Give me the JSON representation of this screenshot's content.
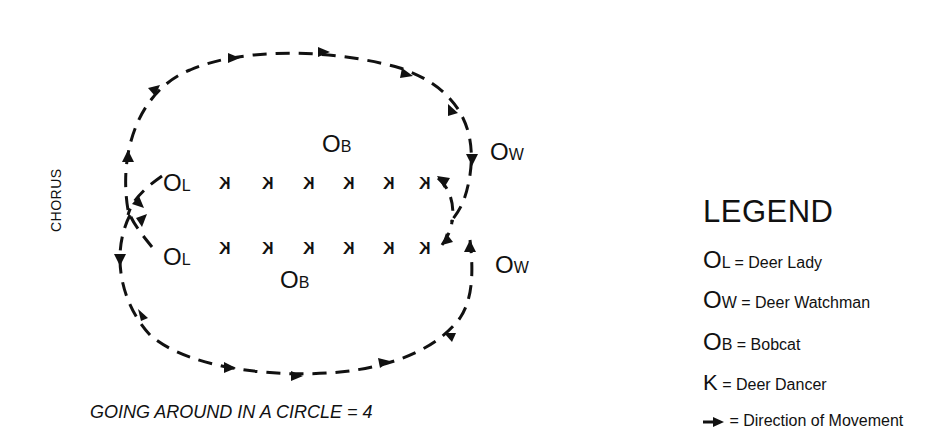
{
  "diagram": {
    "title": "",
    "side_label": "CHORUS",
    "caption": "GOING AROUND IN A CIRCLE = 4",
    "dancer_glyph": "K",
    "figures": {
      "top_row": {
        "lady": {
          "main": "O",
          "sub": "L"
        },
        "bobcat": {
          "main": "O",
          "sub": "B"
        },
        "watchman": {
          "main": "O",
          "sub": "W"
        },
        "dancers": [
          "K",
          "K",
          "K",
          "K",
          "K",
          "K"
        ]
      },
      "bottom_row": {
        "lady": {
          "main": "O",
          "sub": "L"
        },
        "bobcat": {
          "main": "O",
          "sub": "B"
        },
        "watchman": {
          "main": "O",
          "sub": "W"
        },
        "dancers": [
          "K",
          "K",
          "K",
          "K",
          "K",
          "K"
        ]
      }
    },
    "path_style": {
      "stroke": "#111111",
      "dash": "dashed",
      "arrow_icon": "arrow-icon"
    }
  },
  "legend": {
    "title": "LEGEND",
    "items": [
      {
        "symbol_main": "O",
        "symbol_sub": "L",
        "label": "= Deer Lady"
      },
      {
        "symbol_main": "O",
        "symbol_sub": "W",
        "label": "= Deer Watchman"
      },
      {
        "symbol_main": "O",
        "symbol_sub": "B",
        "label": "= Bobcat"
      },
      {
        "symbol_main": "K",
        "symbol_sub": "",
        "label": "= Deer Dancer"
      },
      {
        "symbol_icon": "arrow-icon",
        "label": "= Direction of Movement"
      }
    ]
  }
}
